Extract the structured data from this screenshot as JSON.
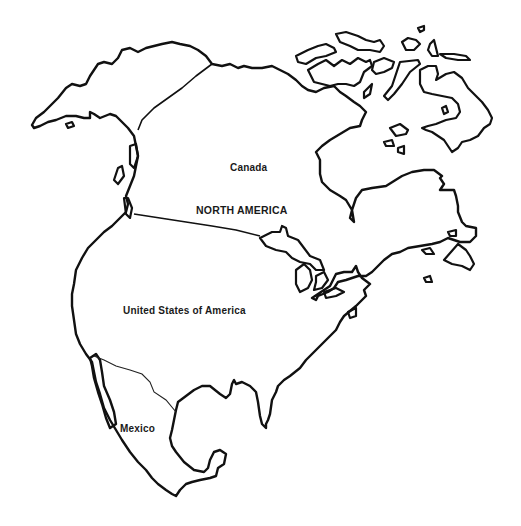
{
  "map": {
    "title": "NORTH AMERICA",
    "countries": [
      {
        "name": "Canada"
      },
      {
        "name": "United States of America"
      },
      {
        "name": "Mexico"
      }
    ],
    "style": {
      "line_color": "#111111",
      "background": "#ffffff"
    }
  }
}
